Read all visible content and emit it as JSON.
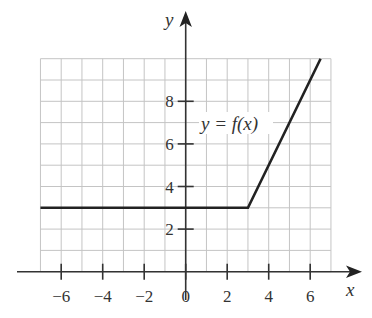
{
  "chart_data": {
    "type": "line",
    "title": "",
    "xlabel": "x",
    "ylabel": "y",
    "annotation": "y = f(x)",
    "xlim": [
      -7,
      7
    ],
    "ylim": [
      0,
      10
    ],
    "grid": true,
    "x_ticks": [
      -6,
      -4,
      -2,
      0,
      2,
      4,
      6
    ],
    "y_ticks": [
      2,
      4,
      6,
      8
    ],
    "series": [
      {
        "name": "y = f(x)",
        "x": [
          -7,
          3,
          6.5
        ],
        "y": [
          3,
          3,
          10
        ]
      }
    ]
  },
  "labels": {
    "x_axis": "x",
    "y_axis": "y",
    "curve": "y = f(x)",
    "x_ticks": [
      "−6",
      "−4",
      "−2",
      "0",
      "2",
      "4",
      "6"
    ],
    "y_ticks": [
      "2",
      "4",
      "6",
      "8"
    ]
  }
}
